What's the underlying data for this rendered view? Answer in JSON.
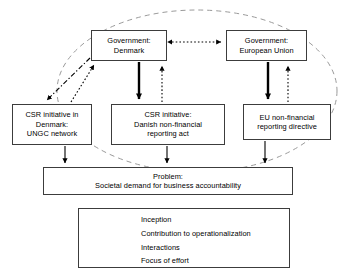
{
  "diagram": {
    "nodes": [
      {
        "id": "gov-dk",
        "name": "government-denmark",
        "lines": [
          "Government:",
          "Denmark"
        ]
      },
      {
        "id": "gov-eu",
        "name": "government-european-union",
        "lines": [
          "Government:",
          "European Union"
        ]
      },
      {
        "id": "ungc",
        "name": "csr-initiative-ungc",
        "lines": [
          "CSR initiative in",
          "Denmark:",
          "UNGC network"
        ]
      },
      {
        "id": "dk-act",
        "name": "csr-initiative-danish-reporting-act",
        "lines": [
          "CSR initiative:",
          "Danish non-financial",
          "reporting act"
        ]
      },
      {
        "id": "eu-dir",
        "name": "eu-non-financial-reporting-directive",
        "lines": [
          "EU non-financial",
          "reporting directive"
        ]
      },
      {
        "id": "problem",
        "name": "problem-societal-demand",
        "lines": [
          "Problem:",
          "Societal demand for business accountability"
        ]
      }
    ],
    "edges": [
      {
        "from": "gov-dk",
        "to": "gov-eu",
        "style": "interactions",
        "bidirectional": true
      },
      {
        "from": "gov-dk",
        "to": "dk-act",
        "style": "inception",
        "bidirectional": false
      },
      {
        "from": "dk-act",
        "to": "gov-dk",
        "style": "interactions",
        "bidirectional": false
      },
      {
        "from": "gov-eu",
        "to": "eu-dir",
        "style": "inception",
        "bidirectional": false
      },
      {
        "from": "eu-dir",
        "to": "gov-eu",
        "style": "interactions",
        "bidirectional": false
      },
      {
        "from": "gov-dk",
        "to": "ungc",
        "style": "contribution",
        "bidirectional": false
      },
      {
        "from": "ungc",
        "to": "gov-dk",
        "style": "interactions",
        "bidirectional": false
      },
      {
        "from": "ungc",
        "to": "problem",
        "style": "focus",
        "bidirectional": false
      },
      {
        "from": "dk-act",
        "to": "problem",
        "style": "focus",
        "bidirectional": false
      },
      {
        "from": "eu-dir",
        "to": "problem",
        "style": "focus",
        "bidirectional": false
      }
    ],
    "grouping_ellipse": {
      "name": "scope-ellipse",
      "style": "dashed"
    },
    "colors": {
      "stroke": "#000000",
      "box_border": "#3c3c3c",
      "ellipse": "#9a9a9a",
      "background": "#ffffff"
    }
  },
  "legend": {
    "name": "legend",
    "items": [
      {
        "style": "inception",
        "label": "Inception"
      },
      {
        "style": "contribution",
        "label": "Contribution to operationalization"
      },
      {
        "style": "interactions",
        "label": "Interactions"
      },
      {
        "style": "focus",
        "label": "Focus of effort"
      }
    ]
  }
}
